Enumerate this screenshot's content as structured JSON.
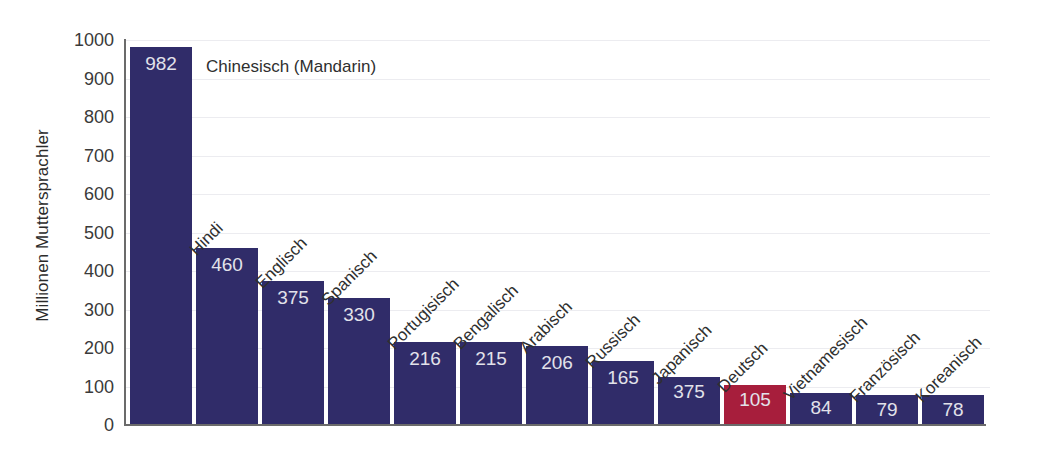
{
  "chart_data": {
    "type": "bar",
    "title": "",
    "xlabel": "",
    "ylabel": "Millionen Muttersprachler",
    "ylim": [
      0,
      1000
    ],
    "grid": true,
    "legend": "none",
    "yticks": [
      1000,
      900,
      800,
      700,
      600,
      500,
      400,
      300,
      200,
      100,
      0
    ],
    "categories": [
      "Chinesisch (Mandarin)",
      "Hindi",
      "Englisch",
      "Spanisch",
      "Portugisisch",
      "Bengalisch",
      "Arabisch",
      "Russisch",
      "Japanisch",
      "Deutsch",
      "Vietnamesisch",
      "Französisch",
      "Koreanisch"
    ],
    "values": [
      982,
      460,
      375,
      330,
      216,
      215,
      206,
      165,
      125,
      105,
      84,
      79,
      78
    ],
    "value_labels": [
      "982",
      "460",
      "375",
      "330",
      "216",
      "215",
      "206",
      "165",
      "375",
      "105",
      "84",
      "79",
      "78"
    ],
    "highlight_index": 9,
    "colors": {
      "bar": "#302c69",
      "highlight": "#a71e3c",
      "value_text": "#e2e2ea",
      "gridline": "#ececf0",
      "axis": "#6b6b6b",
      "label_text": "#2f2f2f",
      "background": "#ffffff"
    }
  }
}
